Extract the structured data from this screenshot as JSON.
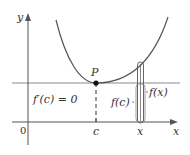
{
  "diagram": {
    "type": "calculus-extremum",
    "colors": {
      "axis": "#555555",
      "curve": "#555555",
      "tangent": "#8a8a8a",
      "point": "#111111",
      "text": "#333333",
      "background": "#ffffff"
    },
    "labels": {
      "y_axis": "y",
      "x_axis": "x",
      "origin": "0",
      "point": "P",
      "derivative": "f′(c) = 0",
      "c_tick": "c",
      "x_tick": "x",
      "f_c": "f(c)",
      "f_x": "f(x)"
    }
  }
}
